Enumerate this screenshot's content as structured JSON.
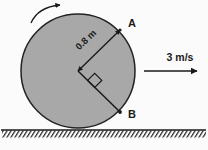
{
  "figure": {
    "background_color": "#fbfbfb",
    "disk": {
      "fill_color": "#a8a8a8",
      "stroke_color": "#222222",
      "center_x": 78,
      "center_y": 71,
      "radius": 57
    },
    "ground": {
      "line_y": 130,
      "color": "#1a1a1a",
      "hatch_label": "ground-hatching"
    },
    "rotation_arrow": {
      "name": "rotation-direction-arrow",
      "direction": "clockwise"
    },
    "points": [
      {
        "id": "A",
        "label": "A",
        "x": 120,
        "y": 30,
        "label_x": 128,
        "label_y": 27
      },
      {
        "id": "B",
        "label": "B",
        "x": 120,
        "y": 112,
        "label_x": 128,
        "label_y": 118
      }
    ],
    "radius_dimension": {
      "label": "0.8 m",
      "rotation_deg": -36,
      "label_x": 88,
      "label_y": 42
    },
    "right_angle_marker": {
      "name": "right-angle-marker",
      "label": "90 degrees"
    },
    "velocity": {
      "label": "3 m/s",
      "label_x": 180,
      "label_y": 61,
      "arrow_x1": 144,
      "arrow_x2": 197,
      "arrow_y": 71,
      "direction": "right"
    }
  }
}
